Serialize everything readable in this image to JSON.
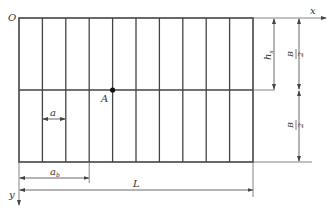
{
  "diagram": {
    "labels": {
      "origin": "O",
      "x_axis": "x",
      "y_axis": "y",
      "point": "A",
      "a": "a",
      "a_sub_base": "a",
      "a_sub": "b",
      "h_base": "h",
      "h_sub": "s",
      "L": "L",
      "B_num": "B",
      "B_den": "2"
    },
    "grid": {
      "columns": 10,
      "rows": 2
    },
    "colors": {
      "line": "#444444",
      "dim": "#666666",
      "point": "#111111"
    }
  }
}
